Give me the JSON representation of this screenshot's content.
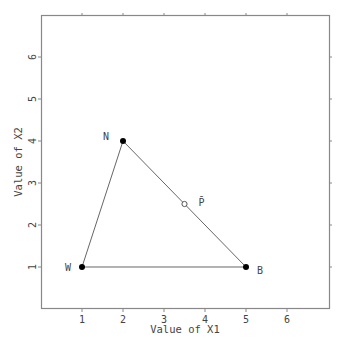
{
  "chart_data": {
    "type": "scatter",
    "title": "",
    "xlabel": "Value of X1",
    "ylabel": "Value of X2",
    "xlim": [
      0,
      7
    ],
    "ylim": [
      0,
      7
    ],
    "x_ticks": [
      1,
      2,
      3,
      4,
      5,
      6
    ],
    "y_ticks": [
      1,
      2,
      3,
      4,
      5,
      6
    ],
    "grid": false,
    "points": [
      {
        "label": "W",
        "x": 1,
        "y": 1,
        "marker": "filled-circle"
      },
      {
        "label": "N",
        "x": 2,
        "y": 4,
        "marker": "filled-circle"
      },
      {
        "label": "B",
        "x": 5,
        "y": 1,
        "marker": "filled-circle"
      },
      {
        "label": "P̄",
        "x": 3.5,
        "y": 2.5,
        "marker": "open-circle"
      }
    ],
    "polygon": [
      "W",
      "N",
      "B"
    ],
    "colors": {
      "axes": "#888888",
      "lines": "#666666",
      "points": "#000000",
      "text": "#444444"
    }
  }
}
